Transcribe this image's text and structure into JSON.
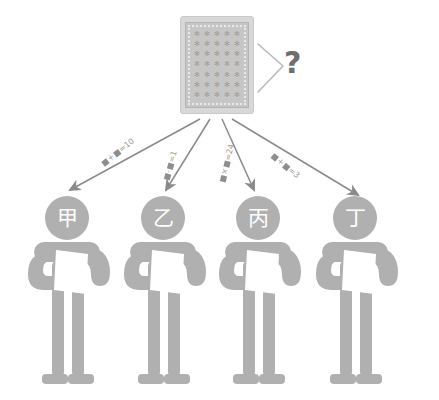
{
  "diagram": {
    "background_color": "#ffffff",
    "figure_color": "#b0b0b0",
    "arrow_color": "#8a8a8a",
    "label_color": "#9a9a9a",
    "card_color": "#d8d8d8"
  },
  "deck": {
    "name": "face-down-card-deck",
    "motif": "✻",
    "motif_rows": 7,
    "motif_cols": 5
  },
  "question": {
    "mark": "?",
    "bracket": "angle-bracket-right"
  },
  "arrows": [
    {
      "id": "arrow-1",
      "target": "甲",
      "equation": {
        "lhs_a": "■",
        "operator": "+",
        "lhs_b": "■",
        "equals": "=",
        "result": "10"
      },
      "equation_text": "■+■=10"
    },
    {
      "id": "arrow-2",
      "target": "乙",
      "equation": {
        "lhs_a": "■",
        "operator": "-",
        "lhs_b": "■",
        "equals": "=",
        "result": "1"
      },
      "equation_text": "■-■=1"
    },
    {
      "id": "arrow-3",
      "target": "丙",
      "equation": {
        "lhs_a": "■",
        "operator": "×",
        "lhs_b": "■",
        "equals": "=",
        "result": "24"
      },
      "equation_text": "■×■=24"
    },
    {
      "id": "arrow-4",
      "target": "丁",
      "equation": {
        "lhs_a": "■",
        "operator": "+",
        "lhs_b": "■",
        "equals": "=",
        "result": "3"
      },
      "equation_text": "■+■=3"
    }
  ],
  "people": [
    {
      "id": "person-jia",
      "label": "甲",
      "holds": "white-card"
    },
    {
      "id": "person-yi",
      "label": "乙",
      "holds": "white-card"
    },
    {
      "id": "person-bing",
      "label": "丙",
      "holds": "white-card"
    },
    {
      "id": "person-ding",
      "label": "丁",
      "holds": "white-card"
    }
  ]
}
